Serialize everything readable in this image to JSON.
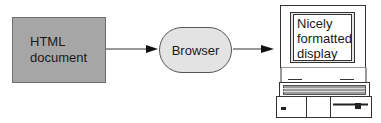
{
  "diagram": {
    "nodes": [
      {
        "id": "html-document",
        "label_line1": "HTML",
        "label_line2": "document",
        "shape": "rectangle",
        "fill": "#a6a6a6"
      },
      {
        "id": "browser",
        "label": "Browser",
        "shape": "rounded-pill",
        "fill": "#e3e3e3"
      },
      {
        "id": "display",
        "label_line1": "Nicely",
        "label_line2": "formatted",
        "label_line3": "display",
        "shape": "laptop-screen"
      }
    ],
    "edges": [
      {
        "from": "html-document",
        "to": "browser"
      },
      {
        "from": "browser",
        "to": "display"
      }
    ]
  }
}
